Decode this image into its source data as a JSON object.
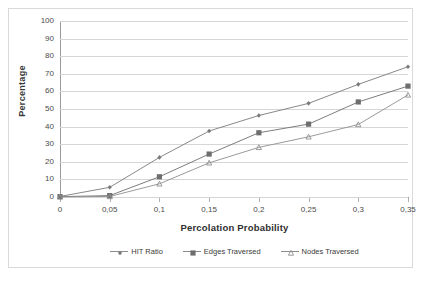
{
  "chart_data": {
    "type": "line",
    "title": "",
    "xlabel": "Percolation Probability",
    "ylabel": "Percentage",
    "x": [
      0,
      0.05,
      0.1,
      0.15,
      0.2,
      0.25,
      0.3,
      0.35
    ],
    "xtick_labels": [
      "0",
      "0,05",
      "0,1",
      "0,15",
      "0,2",
      "0,25",
      "0,3",
      "0,35"
    ],
    "ytick_labels": [
      "0",
      "10",
      "20",
      "30",
      "40",
      "50",
      "60",
      "70",
      "80",
      "90",
      "100"
    ],
    "yticks": [
      0,
      10,
      20,
      30,
      40,
      50,
      60,
      70,
      80,
      90,
      100
    ],
    "ylim": [
      0,
      100
    ],
    "xlim": [
      0,
      0.35
    ],
    "grid": "horizontal",
    "legend_position": "bottom",
    "series": [
      {
        "name": "HIT Ratio",
        "marker": "diamond",
        "color": "#7a7a7a",
        "values": [
          0.3,
          5.5,
          22.5,
          37.5,
          46.3,
          53.2,
          64.0,
          74.0
        ]
      },
      {
        "name": "Edges Traversed",
        "marker": "square",
        "color": "#6e6e6e",
        "values": [
          0.2,
          0.8,
          11.5,
          24.4,
          36.5,
          41.4,
          54.0,
          63.0
        ]
      },
      {
        "name": "Nodes Traversed",
        "marker": "triangle",
        "color": "#8f8f8f",
        "values": [
          0.1,
          0.3,
          7.5,
          19.4,
          28.2,
          34.2,
          41.2,
          58.0
        ]
      }
    ]
  },
  "axis": {
    "y_title": "Percentage",
    "x_title": "Percolation Probability"
  },
  "colors": {
    "gridline": "#d6d6d6",
    "axis": "#9a9a9a",
    "frame": "#d9d9d9",
    "text": "#3a3a3a",
    "background": "#ffffff"
  }
}
